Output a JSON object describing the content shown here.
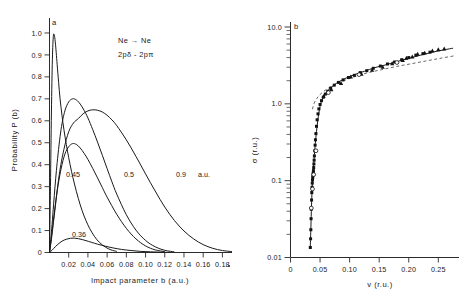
{
  "figure": {
    "background": "#ffffff",
    "ink": "#1a1a1a",
    "panels": [
      "a",
      "b"
    ]
  },
  "panel_a": {
    "label": "a",
    "annotation_line1": "Ne → Ne",
    "annotation_line2": "2pδ - 2pπ",
    "xlabel": "Impact parameter b (a.u.)",
    "ylabel": "Probability P (b)",
    "xticks": [
      "0.02",
      "0.04",
      "0.06",
      "0.08",
      "0.10",
      "0.12",
      "0.14",
      "0.16",
      "0.18"
    ],
    "xtickvals": [
      0.02,
      0.04,
      0.06,
      0.08,
      0.1,
      0.12,
      0.14,
      0.16,
      0.18
    ],
    "yticks": [
      "0",
      "0.1",
      "0.2",
      "0.3",
      "0.4",
      "0.5",
      "0.6",
      "0.7",
      "0.8",
      "0.9",
      "1.0"
    ],
    "ytickvals": [
      0,
      0.1,
      0.2,
      0.3,
      0.4,
      0.5,
      0.6,
      0.7,
      0.8,
      0.9,
      1.0
    ],
    "curve_labels": [
      "0.36",
      "0.45",
      "0.5",
      "0.9"
    ],
    "units_label": "a.u.",
    "xlim": [
      0,
      0.19
    ],
    "ylim": [
      0,
      1.05
    ]
  },
  "panel_b": {
    "label": "b",
    "xlabel": "v (r.u.)",
    "ylabel": "σ (r.u.)",
    "xticks": [
      "0",
      "0.05",
      "0.10",
      "0.15",
      "0.20",
      "0.25"
    ],
    "xtickvals": [
      0,
      0.05,
      0.1,
      0.15,
      0.2,
      0.25
    ],
    "yticks": [
      "0.01",
      "0.1",
      "1.0",
      "10.0"
    ],
    "ytickvals": [
      0.01,
      0.1,
      1.0,
      10.0
    ],
    "xlim": [
      0,
      0.285
    ],
    "ylim": [
      0.01,
      10.0
    ],
    "yscale": "log"
  },
  "chart_data": [
    {
      "type": "line",
      "panel": "a",
      "title": "",
      "xlabel": "Impact parameter b (a.u.)",
      "ylabel": "Probability P (b)",
      "xlim": [
        0,
        0.19
      ],
      "ylim": [
        0,
        1.05
      ],
      "grid": false,
      "legend": "inline-curve-labels",
      "annotations": [
        "Ne → Ne",
        "2pδ - 2pπ"
      ],
      "series": [
        {
          "name": "0.9 a.u.",
          "label": "0.9",
          "x": [
            0.0,
            0.002,
            0.005,
            0.01,
            0.015,
            0.02,
            0.025,
            0.03,
            0.035,
            0.04,
            0.045,
            0.05,
            0.055,
            0.06,
            0.065,
            0.07,
            0.08,
            0.09,
            0.1,
            0.11,
            0.12,
            0.13,
            0.14,
            0.15,
            0.16,
            0.17,
            0.18,
            0.19
          ],
          "y": [
            0.0,
            0.06,
            0.17,
            0.35,
            0.47,
            0.55,
            0.59,
            0.61,
            0.632,
            0.645,
            0.65,
            0.648,
            0.64,
            0.625,
            0.604,
            0.578,
            0.513,
            0.438,
            0.358,
            0.28,
            0.207,
            0.146,
            0.098,
            0.062,
            0.036,
            0.019,
            0.009,
            0.004
          ]
        },
        {
          "name": "0.5 a.u.",
          "label": "0.5",
          "x": [
            0.0,
            0.002,
            0.005,
            0.008,
            0.012,
            0.016,
            0.02,
            0.024,
            0.028,
            0.032,
            0.036,
            0.04,
            0.045,
            0.05,
            0.055,
            0.06,
            0.065,
            0.07,
            0.08,
            0.09,
            0.1,
            0.11,
            0.12,
            0.13
          ],
          "y": [
            0.0,
            0.09,
            0.26,
            0.41,
            0.56,
            0.645,
            0.686,
            0.7,
            0.695,
            0.676,
            0.648,
            0.613,
            0.56,
            0.503,
            0.443,
            0.382,
            0.322,
            0.266,
            0.172,
            0.102,
            0.055,
            0.026,
            0.01,
            0.003
          ]
        },
        {
          "name": "0.45 a.u.",
          "label": "0.45",
          "x": [
            0.0,
            0.002,
            0.005,
            0.008,
            0.012,
            0.016,
            0.02,
            0.024,
            0.028,
            0.032,
            0.036,
            0.04,
            0.045,
            0.05,
            0.055,
            0.06,
            0.07,
            0.08,
            0.09,
            0.1,
            0.11,
            0.12
          ],
          "y": [
            0.0,
            0.07,
            0.18,
            0.28,
            0.38,
            0.448,
            0.482,
            0.496,
            0.492,
            0.476,
            0.452,
            0.424,
            0.383,
            0.34,
            0.296,
            0.252,
            0.174,
            0.11,
            0.062,
            0.03,
            0.012,
            0.004
          ]
        },
        {
          "name": "0.36 a.u.",
          "label": "0.36",
          "x": [
            0.0,
            0.003,
            0.006,
            0.01,
            0.014,
            0.018,
            0.022,
            0.026,
            0.03,
            0.034,
            0.038,
            0.044,
            0.05,
            0.058,
            0.066,
            0.075,
            0.085,
            0.095,
            0.105,
            0.115,
            0.125
          ],
          "y": [
            0.0,
            0.012,
            0.026,
            0.042,
            0.054,
            0.061,
            0.065,
            0.0655,
            0.063,
            0.059,
            0.054,
            0.046,
            0.038,
            0.029,
            0.021,
            0.014,
            0.009,
            0.005,
            0.003,
            0.0015,
            0.0006
          ]
        },
        {
          "name": "narrow-peak",
          "label": "",
          "x": [
            0.0,
            0.001,
            0.002,
            0.003,
            0.004,
            0.005,
            0.006,
            0.007,
            0.008,
            0.0095,
            0.011,
            0.013,
            0.015,
            0.0175,
            0.02,
            0.023,
            0.026,
            0.03,
            0.034,
            0.038,
            0.042,
            0.047,
            0.052,
            0.058,
            0.064,
            0.07
          ],
          "y": [
            0.0,
            0.3,
            0.64,
            0.88,
            0.985,
            0.99,
            0.96,
            0.91,
            0.855,
            0.775,
            0.7,
            0.625,
            0.56,
            0.492,
            0.432,
            0.368,
            0.312,
            0.246,
            0.19,
            0.145,
            0.108,
            0.072,
            0.046,
            0.025,
            0.012,
            0.005
          ]
        }
      ]
    },
    {
      "type": "scatter",
      "panel": "b",
      "title": "",
      "xlabel": "v (r.u.)",
      "ylabel": "σ (r.u.)",
      "xlim": [
        0,
        0.285
      ],
      "ylim": [
        0.01,
        10.0
      ],
      "yscale": "log",
      "grid": false,
      "series": [
        {
          "name": "measured-filled-squares",
          "marker": "filled-square",
          "x": [
            0.0335,
            0.034,
            0.0344,
            0.0348,
            0.0352,
            0.0356,
            0.036,
            0.0364,
            0.0368,
            0.0372,
            0.0376,
            0.038,
            0.0384,
            0.0388,
            0.0392,
            0.0396,
            0.04,
            0.0404,
            0.041,
            0.0416,
            0.0422,
            0.043,
            0.044,
            0.045,
            0.0465,
            0.048,
            0.05,
            0.0525,
            0.0555,
            0.059,
            0.063,
            0.068,
            0.074,
            0.081,
            0.089,
            0.098,
            0.108,
            0.118,
            0.129,
            0.14,
            0.152,
            0.164,
            0.176,
            0.188,
            0.2,
            0.212,
            0.224,
            0.236
          ],
          "y": [
            0.0135,
            0.0175,
            0.023,
            0.032,
            0.0425,
            0.056,
            0.07,
            0.082,
            0.093,
            0.102,
            0.11,
            0.118,
            0.126,
            0.135,
            0.148,
            0.165,
            0.185,
            0.21,
            0.245,
            0.29,
            0.34,
            0.41,
            0.51,
            0.62,
            0.74,
            0.86,
            0.98,
            1.1,
            1.22,
            1.34,
            1.46,
            1.6,
            1.75,
            1.9,
            2.05,
            2.2,
            2.35,
            2.55,
            2.7,
            2.9,
            3.1,
            3.3,
            3.5,
            3.75,
            4.0,
            4.3,
            4.5,
            4.7
          ]
        },
        {
          "name": "measured-triangles",
          "marker": "triangle",
          "x": [
            0.056,
            0.069,
            0.0855,
            0.102,
            0.12,
            0.138,
            0.156,
            0.172,
            0.19,
            0.196,
            0.206,
            0.215,
            0.227,
            0.24,
            0.25,
            0.26
          ],
          "y": [
            1.26,
            1.54,
            1.85,
            2.25,
            2.45,
            2.75,
            3.0,
            3.35,
            3.7,
            3.95,
            4.1,
            4.45,
            4.6,
            4.9,
            5.1,
            5.2
          ]
        },
        {
          "name": "measured-open-circles",
          "marker": "open-circle",
          "x": [
            0.0352,
            0.0372,
            0.0392,
            0.043,
            0.064,
            0.116,
            0.18
          ],
          "y": [
            0.044,
            0.078,
            0.12,
            0.245,
            1.4,
            2.4,
            3.45
          ]
        },
        {
          "name": "theory-solid",
          "marker": "none",
          "style": "solid-line",
          "x": [
            0.0335,
            0.0345,
            0.0355,
            0.0365,
            0.0375,
            0.0385,
            0.0395,
            0.0405,
            0.042,
            0.044,
            0.047,
            0.051,
            0.056,
            0.063,
            0.072,
            0.083,
            0.096,
            0.11,
            0.125,
            0.142,
            0.16,
            0.18,
            0.2,
            0.22,
            0.24,
            0.26,
            0.275
          ],
          "y": [
            0.014,
            0.025,
            0.046,
            0.076,
            0.108,
            0.133,
            0.174,
            0.22,
            0.305,
            0.44,
            0.68,
            1.0,
            1.24,
            1.48,
            1.72,
            1.96,
            2.2,
            2.43,
            2.65,
            2.95,
            3.2,
            3.55,
            3.9,
            4.3,
            4.7,
            5.05,
            5.3
          ]
        },
        {
          "name": "theory-dashed",
          "marker": "none",
          "style": "dashed-line",
          "x": [
            0.037,
            0.04,
            0.044,
            0.049,
            0.056,
            0.065,
            0.078,
            0.094,
            0.112,
            0.132,
            0.154,
            0.178,
            0.202,
            0.228,
            0.252,
            0.276
          ],
          "y": [
            0.85,
            1.02,
            1.16,
            1.3,
            1.45,
            1.62,
            1.82,
            2.06,
            2.3,
            2.55,
            2.78,
            3.05,
            3.3,
            3.6,
            3.9,
            4.2
          ]
        }
      ]
    }
  ]
}
